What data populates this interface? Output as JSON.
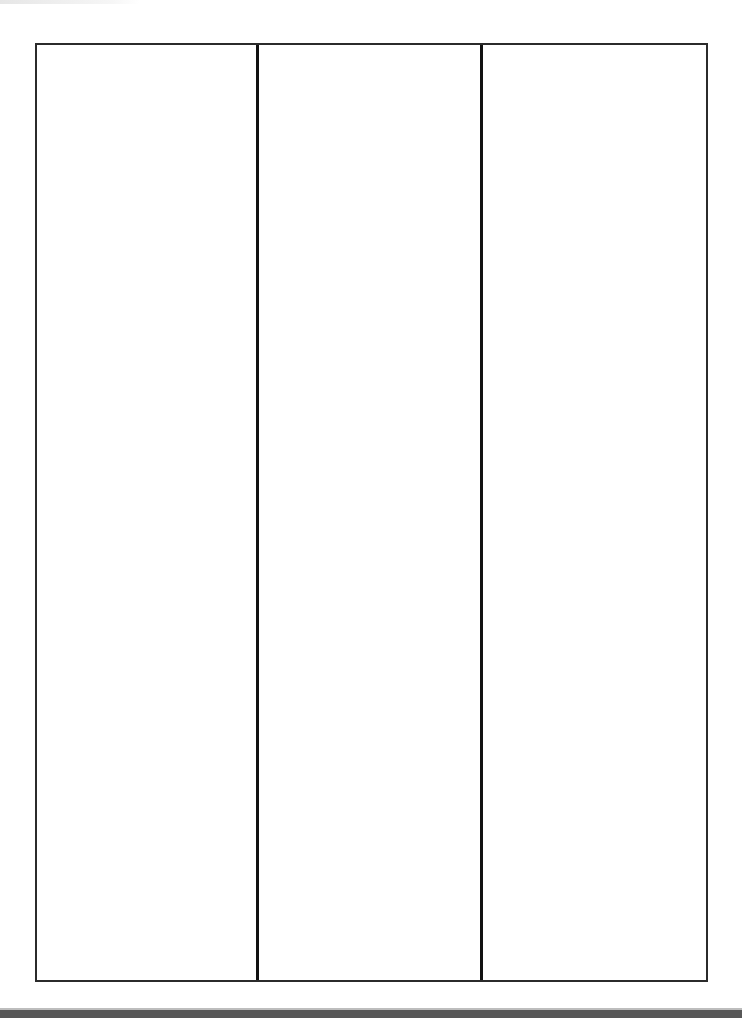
{
  "document": {
    "type": "blank-three-column-table",
    "columns": [
      {
        "index": 1,
        "content": ""
      },
      {
        "index": 2,
        "content": ""
      },
      {
        "index": 3,
        "content": ""
      }
    ]
  },
  "colors": {
    "background": "#ffffff",
    "border": "#111111",
    "bottom_band": "#575757"
  }
}
